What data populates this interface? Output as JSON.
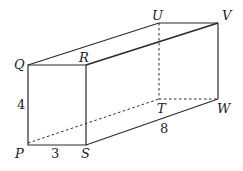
{
  "diagram": {
    "type": "rectangular-prism",
    "vertices": {
      "P": {
        "label": "P",
        "x": 28,
        "y": 145
      },
      "Q": {
        "label": "Q",
        "x": 28,
        "y": 65
      },
      "R": {
        "label": "R",
        "x": 86,
        "y": 65
      },
      "S": {
        "label": "S",
        "x": 86,
        "y": 145
      },
      "T": {
        "label": "T",
        "x": 159,
        "y": 99
      },
      "U": {
        "label": "U",
        "x": 159,
        "y": 23
      },
      "V": {
        "label": "V",
        "x": 218,
        "y": 23
      },
      "W": {
        "label": "W",
        "x": 218,
        "y": 99
      }
    },
    "dimensions": {
      "PQ": "4",
      "PS": "3",
      "SW": "8"
    }
  }
}
